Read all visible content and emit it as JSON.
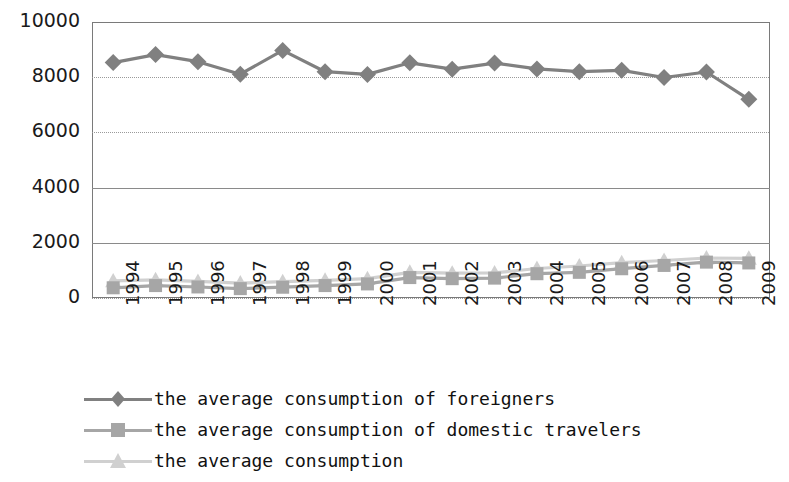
{
  "chart_data": {
    "type": "line",
    "title": "",
    "xlabel": "",
    "ylabel": "",
    "ylim": [
      0,
      10000
    ],
    "ytick_labels": [
      "10000",
      "8000",
      "6000",
      "4000",
      "2000",
      "0"
    ],
    "ytick_values": [
      10000,
      8000,
      6000,
      4000,
      2000,
      0
    ],
    "grid": true,
    "legend_position": "bottom-left",
    "categories": [
      "1994",
      "1995",
      "1996",
      "1997",
      "1998",
      "1999",
      "2000",
      "2001",
      "2002",
      "2003",
      "2004",
      "2005",
      "2006",
      "2007",
      "2008",
      "2009"
    ],
    "series": [
      {
        "name": "the average consumption of foreigners",
        "marker": "diamond",
        "color": "#808080",
        "values": [
          8530,
          8820,
          8560,
          8110,
          8970,
          8200,
          8100,
          8520,
          8290,
          8510,
          8300,
          8200,
          8250,
          7990,
          8190,
          7200
        ]
      },
      {
        "name": "the average consumption of domestic travelers",
        "marker": "square",
        "color": "#a6a6a6",
        "values": [
          370,
          450,
          400,
          340,
          390,
          450,
          510,
          740,
          700,
          720,
          880,
          930,
          1060,
          1180,
          1300,
          1270
        ]
      },
      {
        "name": "the average consumption",
        "marker": "triangle",
        "color": "#d0d0d0",
        "values": [
          620,
          660,
          600,
          540,
          590,
          640,
          700,
          930,
          900,
          910,
          1070,
          1160,
          1280,
          1360,
          1450,
          1440
        ]
      }
    ]
  },
  "legend": {
    "items": [
      {
        "label": "the average consumption of foreigners"
      },
      {
        "label": "the average consumption of domestic travelers"
      },
      {
        "label": "the average consumption"
      }
    ]
  }
}
